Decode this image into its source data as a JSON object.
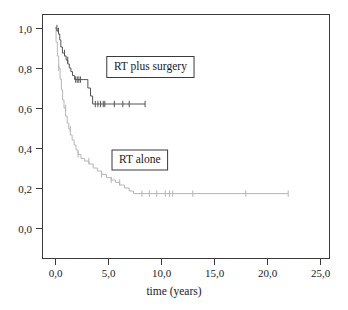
{
  "chart_data": {
    "type": "line",
    "title": "",
    "subtitle": "",
    "xlabel": "time (years)",
    "ylabel": "",
    "xlim": [
      0,
      25
    ],
    "ylim": [
      0,
      1.0
    ],
    "grid": false,
    "legend_position": "inside-plot-boxed-annotations",
    "x_tick_labels": [
      "0,0",
      "5,0",
      "10,0",
      "15,0",
      "20,0",
      "25,0"
    ],
    "x_tick_values": [
      0,
      5,
      10,
      15,
      20,
      25
    ],
    "y_tick_labels": [
      "0,0",
      "0,2",
      "0,4",
      "0,6",
      "0,8",
      "1,0"
    ],
    "y_tick_values": [
      0.0,
      0.2,
      0.4,
      0.6,
      0.8,
      1.0
    ],
    "annotations": [
      {
        "text": "RT plus surgery",
        "x": 9.0,
        "y": 0.81
      },
      {
        "text": "RT alone",
        "x": 8.0,
        "y": 0.345
      }
    ],
    "series": [
      {
        "name": "RT plus surgery",
        "color": "#555555",
        "style": "step",
        "points": [
          [
            0.0,
            1.0
          ],
          [
            0.18,
            1.0
          ],
          [
            0.18,
            0.985
          ],
          [
            0.33,
            0.985
          ],
          [
            0.33,
            0.97
          ],
          [
            0.45,
            0.97
          ],
          [
            0.45,
            0.94
          ],
          [
            0.55,
            0.94
          ],
          [
            0.55,
            0.905
          ],
          [
            0.7,
            0.905
          ],
          [
            0.7,
            0.875
          ],
          [
            0.9,
            0.875
          ],
          [
            0.9,
            0.86
          ],
          [
            1.05,
            0.86
          ],
          [
            1.05,
            0.84
          ],
          [
            1.2,
            0.84
          ],
          [
            1.2,
            0.82
          ],
          [
            1.35,
            0.82
          ],
          [
            1.35,
            0.8
          ],
          [
            1.5,
            0.8
          ],
          [
            1.5,
            0.782
          ],
          [
            1.65,
            0.782
          ],
          [
            1.65,
            0.762
          ],
          [
            1.85,
            0.762
          ],
          [
            1.85,
            0.742
          ],
          [
            3.1,
            0.742
          ],
          [
            3.1,
            0.7
          ],
          [
            3.35,
            0.7
          ],
          [
            3.35,
            0.66
          ],
          [
            3.55,
            0.66
          ],
          [
            3.55,
            0.62
          ],
          [
            8.5,
            0.62
          ]
        ],
        "censor_marks": [
          [
            0.18,
            1.0
          ],
          [
            0.33,
            0.985
          ],
          [
            0.9,
            0.875
          ],
          [
            1.2,
            0.84
          ],
          [
            1.95,
            0.742
          ],
          [
            2.1,
            0.742
          ],
          [
            2.25,
            0.742
          ],
          [
            2.4,
            0.742
          ],
          [
            3.8,
            0.62
          ],
          [
            4.05,
            0.62
          ],
          [
            4.3,
            0.62
          ],
          [
            4.55,
            0.62
          ],
          [
            4.7,
            0.62
          ],
          [
            5.6,
            0.62
          ],
          [
            6.4,
            0.62
          ],
          [
            7.0,
            0.62
          ],
          [
            8.5,
            0.62
          ]
        ]
      },
      {
        "name": "RT alone",
        "color": "#b6b6b6",
        "style": "step",
        "points": [
          [
            0.0,
            1.0
          ],
          [
            0.1,
            1.0
          ],
          [
            0.1,
            0.93
          ],
          [
            0.22,
            0.93
          ],
          [
            0.22,
            0.86
          ],
          [
            0.35,
            0.86
          ],
          [
            0.35,
            0.8
          ],
          [
            0.48,
            0.8
          ],
          [
            0.48,
            0.745
          ],
          [
            0.6,
            0.745
          ],
          [
            0.6,
            0.69
          ],
          [
            0.72,
            0.69
          ],
          [
            0.72,
            0.64
          ],
          [
            0.85,
            0.64
          ],
          [
            0.85,
            0.6
          ],
          [
            1.0,
            0.6
          ],
          [
            1.0,
            0.56
          ],
          [
            1.15,
            0.56
          ],
          [
            1.15,
            0.525
          ],
          [
            1.3,
            0.525
          ],
          [
            1.3,
            0.495
          ],
          [
            1.45,
            0.495
          ],
          [
            1.45,
            0.465
          ],
          [
            1.62,
            0.465
          ],
          [
            1.62,
            0.44
          ],
          [
            1.8,
            0.44
          ],
          [
            1.8,
            0.415
          ],
          [
            1.98,
            0.415
          ],
          [
            1.98,
            0.39
          ],
          [
            2.18,
            0.39
          ],
          [
            2.18,
            0.368
          ],
          [
            2.45,
            0.368
          ],
          [
            2.45,
            0.348
          ],
          [
            2.8,
            0.348
          ],
          [
            2.8,
            0.335
          ],
          [
            3.2,
            0.335
          ],
          [
            3.2,
            0.32
          ],
          [
            3.6,
            0.32
          ],
          [
            3.6,
            0.3
          ],
          [
            4.0,
            0.3
          ],
          [
            4.0,
            0.285
          ],
          [
            4.4,
            0.285
          ],
          [
            4.4,
            0.268
          ],
          [
            4.85,
            0.268
          ],
          [
            4.85,
            0.252
          ],
          [
            5.3,
            0.252
          ],
          [
            5.3,
            0.24
          ],
          [
            5.7,
            0.24
          ],
          [
            5.7,
            0.228
          ],
          [
            6.1,
            0.228
          ],
          [
            6.1,
            0.215
          ],
          [
            6.55,
            0.215
          ],
          [
            6.55,
            0.2
          ],
          [
            7.0,
            0.2
          ],
          [
            7.0,
            0.185
          ],
          [
            7.4,
            0.185
          ],
          [
            7.4,
            0.172
          ],
          [
            22.0,
            0.172
          ]
        ],
        "censor_marks": [
          [
            0.35,
            0.8
          ],
          [
            1.0,
            0.6
          ],
          [
            1.45,
            0.495
          ],
          [
            2.18,
            0.368
          ],
          [
            3.2,
            0.335
          ],
          [
            4.4,
            0.268
          ],
          [
            5.3,
            0.24
          ],
          [
            6.1,
            0.228
          ],
          [
            8.2,
            0.172
          ],
          [
            8.9,
            0.172
          ],
          [
            9.6,
            0.172
          ],
          [
            10.4,
            0.172
          ],
          [
            10.8,
            0.172
          ],
          [
            11.1,
            0.172
          ],
          [
            13.0,
            0.172
          ],
          [
            18.0,
            0.172
          ],
          [
            22.0,
            0.172
          ]
        ]
      }
    ]
  },
  "axes": {
    "x_axis_title": "time (years)"
  }
}
